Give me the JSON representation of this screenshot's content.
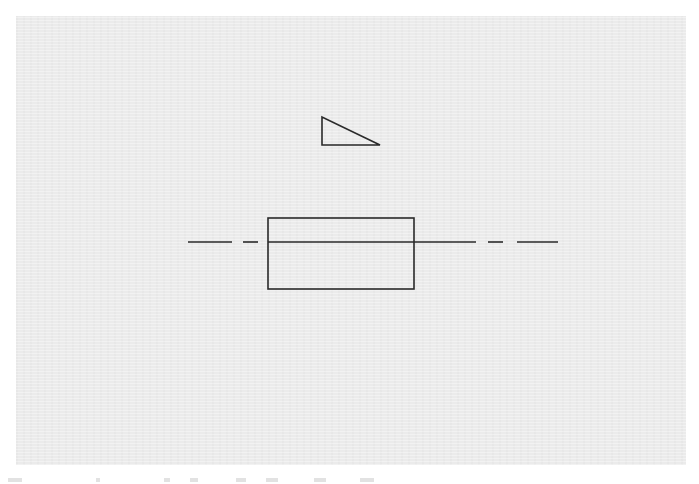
{
  "diagram": {
    "type": "technical-drawing",
    "background_color": "#ebebeb",
    "stroke_color": "#2a2a2a",
    "panel": {
      "x": 16,
      "y": 16,
      "width": 670,
      "height": 449
    },
    "triangle": {
      "shape": "right-triangle",
      "points": [
        [
          322,
          117
        ],
        [
          322,
          145
        ],
        [
          380,
          145
        ]
      ]
    },
    "rectangle": {
      "x": 268,
      "y": 218,
      "width": 146,
      "height": 71
    },
    "centerline": {
      "style": "dash-dot",
      "y": 242,
      "segments": [
        [
          188,
          232
        ],
        [
          243,
          258
        ],
        [
          268,
          476
        ],
        [
          488,
          503
        ],
        [
          517,
          558
        ]
      ]
    }
  }
}
